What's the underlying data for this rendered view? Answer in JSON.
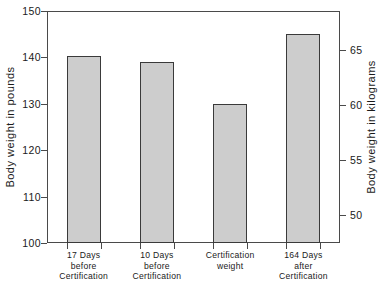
{
  "chart_data": {
    "type": "bar",
    "title": "",
    "subtitle": "",
    "xlabel": "",
    "ylabel": "Body weight in pounds",
    "ylabel_secondary": "Body weight in kilograms",
    "categories": [
      "17 Days before Certification",
      "10 Days before Certification",
      "Certification weight",
      "164 Days after Certification"
    ],
    "category_lines": [
      [
        "17 Days",
        "before",
        "Certification"
      ],
      [
        "10 Days",
        "before",
        "Certification"
      ],
      [
        "Certification",
        "weight"
      ],
      [
        "164 Days",
        "after",
        "Certification"
      ]
    ],
    "values": [
      140.3,
      139.0,
      130.0,
      145.0
    ],
    "values_kg": [
      63.6,
      63.0,
      59.0,
      65.8
    ],
    "ylim": [
      100,
      150
    ],
    "ylim_secondary": [
      47.5,
      68.5
    ],
    "yticks": [
      100,
      110,
      120,
      130,
      140,
      150
    ],
    "ytick_labels": [
      "100",
      "110",
      "120",
      "130",
      "140",
      "150"
    ],
    "yticks_secondary": [
      50,
      55,
      60,
      65
    ],
    "ytick_labels_secondary": [
      "50",
      "55",
      "60",
      "65"
    ],
    "grid": false,
    "legend": false,
    "legend_position": "none",
    "bar_fill_color": "#cdcdcd",
    "bar_edge_color": "#3a3a3a",
    "axis_color": "#4a4a4a",
    "background_color": "#ffffff"
  }
}
